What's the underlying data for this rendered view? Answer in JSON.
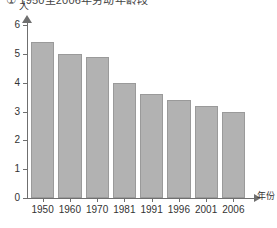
{
  "chart_data": {
    "type": "bar",
    "title": "① 1950至2006年劳动年龄段",
    "subtitle": "",
    "xlabel": "年份",
    "ylabel": "人",
    "categories": [
      "1950",
      "1960",
      "1970",
      "1981",
      "1991",
      "1996",
      "2001",
      "2006"
    ],
    "values": [
      5.4,
      5.0,
      4.9,
      4.0,
      3.6,
      3.4,
      3.2,
      3.0
    ],
    "ylim": [
      0,
      6
    ],
    "yticks": [
      "0",
      "1",
      "2",
      "3",
      "4",
      "5",
      "6"
    ],
    "grid": false,
    "legend": "none",
    "series": [
      {
        "name": "人数",
        "values": [
          5.4,
          5.0,
          4.9,
          4.0,
          3.6,
          3.4,
          3.2,
          3.0
        ]
      }
    ],
    "bar_color": "#b2b2b2",
    "bar_border_color": "#9a9a9a",
    "axis_color": "#6f6f6f"
  },
  "axes": {
    "y_unit_label": "人",
    "x_unit_label": "年份"
  }
}
